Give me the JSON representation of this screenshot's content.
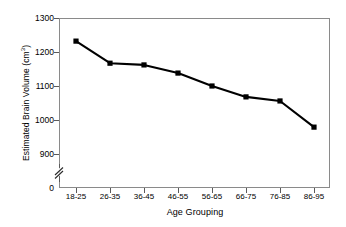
{
  "chart_data": {
    "type": "line",
    "title": "",
    "subtitle": "",
    "xlabel": "Age Grouping",
    "ylabel": "Estimated Brain Volume (cm³)",
    "ylabel_base": "Estimated Brain Volume (cm",
    "ylabel_sup": "3",
    "ylabel_close": ")",
    "categories": [
      "18-25",
      "26-35",
      "36-45",
      "46-55",
      "56-65",
      "66-75",
      "76-85",
      "86-95"
    ],
    "values": [
      1232,
      1167,
      1162,
      1138,
      1100,
      1068,
      1056,
      979
    ],
    "series": [
      {
        "name": "Estimated Brain Volume",
        "values": [
          1232,
          1167,
          1162,
          1138,
          1100,
          1068,
          1056,
          979
        ]
      }
    ],
    "ylim": [
      880,
      1300
    ],
    "y_ticks": [
      1300,
      1200,
      1100,
      1000,
      900
    ],
    "y_tick_labels": [
      "1300",
      "1200",
      "1100",
      "1000",
      "900"
    ],
    "y_origin_label": "0",
    "axis_break": true,
    "grid": false,
    "legend": false,
    "legend_position": "none",
    "marker": "square",
    "marker_color": "#000000",
    "line_color": "#000000",
    "frame_color": "#8a8a8a",
    "background": "#ffffff"
  }
}
